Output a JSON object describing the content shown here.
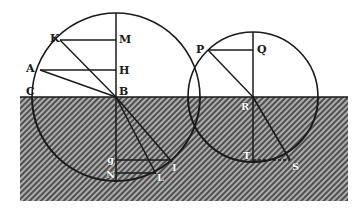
{
  "colors": {
    "ink": "#1a1a1a",
    "paper": "#ffffff",
    "hatch_bg": "#5a5a5a",
    "hatch_line": "#d8d8d8"
  },
  "medium": {
    "x": 20,
    "y": 97,
    "width": 328,
    "height": 104
  },
  "large_circle": {
    "center": "B",
    "cx": 116,
    "cy": 97,
    "r": 84
  },
  "small_circle": {
    "center": "R",
    "cx": 253,
    "cy": 97,
    "r": 65
  },
  "labels": {
    "K": "K",
    "M": "M",
    "A": "A",
    "H": "H",
    "C": "C",
    "B": "B",
    "G": "g",
    "N": "N",
    "L": "L",
    "I": "I",
    "P": "P",
    "Q": "Q",
    "R": "R",
    "T": "T",
    "S": "S"
  },
  "points": {
    "K": [
      60,
      40
    ],
    "M": [
      116,
      40
    ],
    "A": [
      40,
      70
    ],
    "H": [
      116,
      70
    ],
    "C": [
      33,
      97
    ],
    "B": [
      116,
      97
    ],
    "G": [
      116,
      160
    ],
    "N": [
      116,
      173
    ],
    "I": [
      170,
      160
    ],
    "L": [
      155,
      173
    ],
    "P": [
      208,
      50
    ],
    "Q": [
      253,
      50
    ],
    "R": [
      253,
      97
    ],
    "T": [
      253,
      160
    ],
    "S": [
      290,
      160
    ]
  }
}
